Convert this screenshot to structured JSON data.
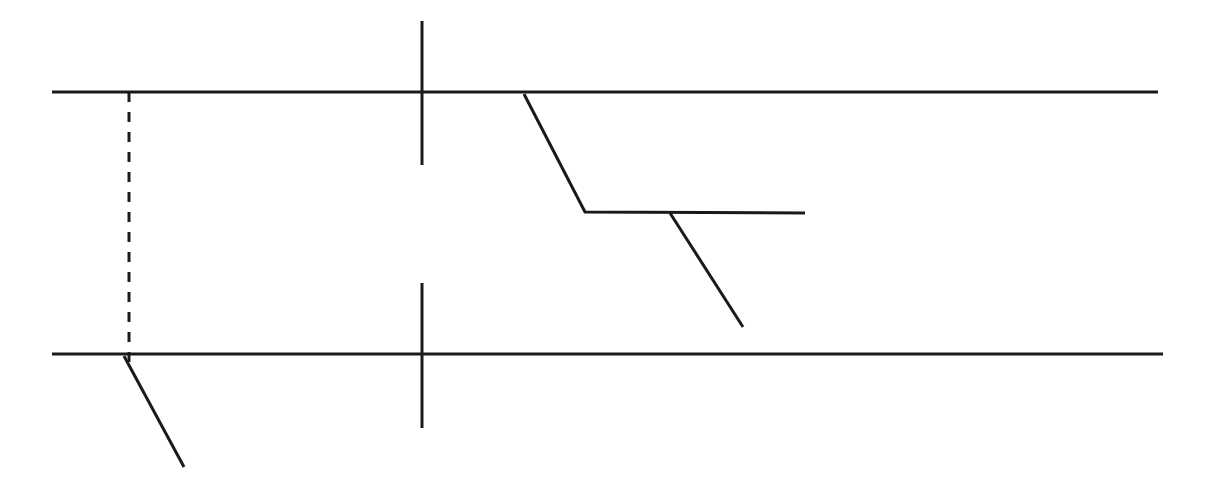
{
  "canvas": {
    "width": 1208,
    "height": 497,
    "background_color": "#ffffff",
    "title": "Line Diagram"
  },
  "style": {
    "stroke_color": "#1a1a1a",
    "rail_stroke_width": 3,
    "tick_stroke_width": 3,
    "polyline_stroke_width": 3,
    "dash_stroke_width": 3,
    "dash_pattern": "10 10"
  },
  "chart_data": {
    "type": "line",
    "xlabel": "",
    "ylabel": "",
    "xlim": [
      0,
      1208
    ],
    "ylim": [
      0,
      497
    ],
    "grid": false,
    "legend": "none",
    "series": [
      {
        "name": "top-rail",
        "kind": "solid",
        "points": [
          [
            52,
            92
          ],
          [
            1158,
            92
          ]
        ]
      },
      {
        "name": "bottom-rail",
        "kind": "solid",
        "points": [
          [
            52,
            354
          ],
          [
            1163,
            354
          ]
        ]
      },
      {
        "name": "upper-vertical-tick",
        "kind": "solid",
        "points": [
          [
            422,
            21
          ],
          [
            422,
            165
          ]
        ]
      },
      {
        "name": "lower-vertical-tick",
        "kind": "solid",
        "points": [
          [
            422,
            283
          ],
          [
            422,
            428
          ]
        ]
      },
      {
        "name": "dashed-reference-line",
        "kind": "dashed",
        "points": [
          [
            129,
            92
          ],
          [
            129,
            365
          ]
        ]
      },
      {
        "name": "stepped-polyline",
        "kind": "solid",
        "points": [
          [
            524,
            94
          ],
          [
            585,
            212
          ],
          [
            805,
            213
          ]
        ]
      },
      {
        "name": "branch-diagonal-right",
        "kind": "solid",
        "points": [
          [
            670,
            213
          ],
          [
            743,
            327
          ]
        ]
      },
      {
        "name": "branch-diagonal-left",
        "kind": "solid",
        "points": [
          [
            124,
            356
          ],
          [
            184,
            467
          ]
        ]
      }
    ]
  }
}
